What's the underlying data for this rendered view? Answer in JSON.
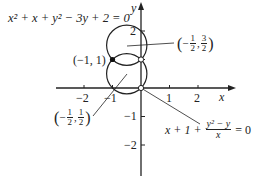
{
  "equations": {
    "top_curve": "x² + x + y² − 3y + 2 = 0",
    "bottom_curve_prefix": "x + 1 +",
    "bottom_curve_num": "y² − y",
    "bottom_curve_den": "x",
    "bottom_curve_suffix": "= 0"
  },
  "points": {
    "filled": "(−1, 1)",
    "upper_center": {
      "neg": "−",
      "x_num": "1",
      "x_den": "2",
      "y_num": "3",
      "y_den": "2"
    },
    "lower_center": {
      "neg": "−",
      "x_num": "1",
      "x_den": "2",
      "y_num": "1",
      "y_den": "2"
    }
  },
  "axes": {
    "x_label": "x",
    "y_label": "y",
    "x_ticks": [
      "−2",
      "−1",
      "1",
      "2"
    ],
    "y_ticks": [
      "2",
      "−1",
      "−2"
    ]
  },
  "colors": {
    "ink": "#222222",
    "background": "#ffffff"
  }
}
